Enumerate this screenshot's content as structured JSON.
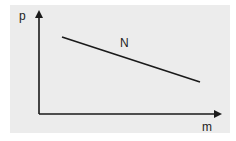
{
  "diagram": {
    "axes": {
      "y_label": "p",
      "x_label": "m"
    },
    "curve": {
      "label": "N",
      "description": "straight line decreasing from upper-left to lower-right",
      "start": [
        62,
        37
      ],
      "end": [
        200,
        82
      ]
    },
    "colors": {
      "background": "#ececec",
      "line": "#1a1a1a"
    }
  }
}
